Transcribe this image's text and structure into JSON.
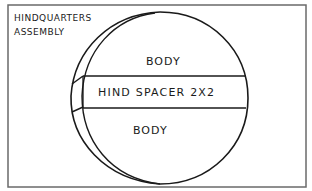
{
  "diagram": {
    "title_lines": [
      "HINDQUARTERS",
      "ASSEMBLY"
    ],
    "sections": [
      {
        "label": "BODY",
        "position": "top"
      },
      {
        "label": "HIND SPACER 2X2",
        "position": "middle"
      },
      {
        "label": "BODY",
        "position": "bottom"
      }
    ],
    "colors": {
      "stroke": "#1a1a1a",
      "frame": "#555555",
      "background": "#ffffff"
    }
  }
}
